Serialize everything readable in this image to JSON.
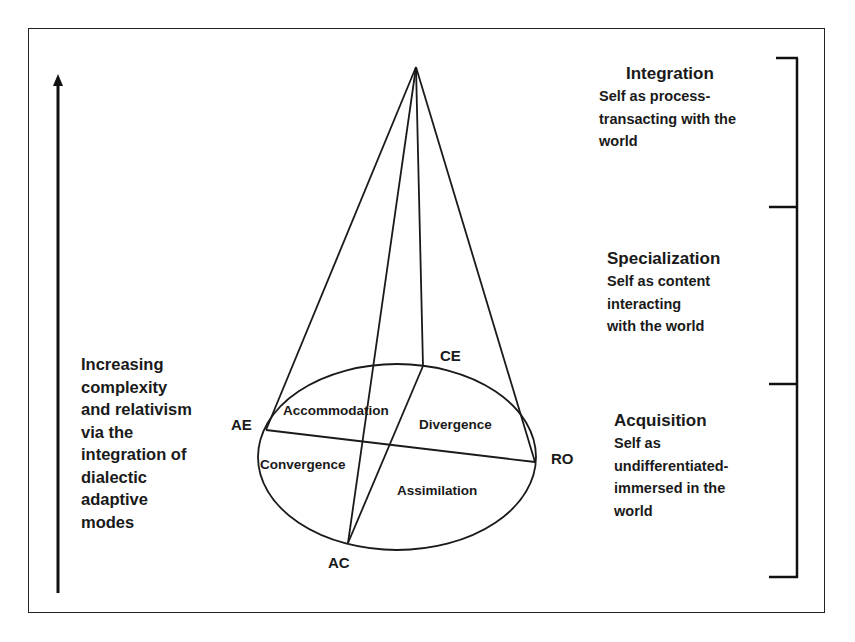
{
  "diagram": {
    "type": "cone-model",
    "axis": {
      "direction": "up",
      "lines": [
        "Increasing",
        "complexity",
        "and relativism",
        "via the",
        "integration of",
        "dialectic",
        "adaptive",
        "modes"
      ]
    },
    "poles": {
      "ae": "AE",
      "ce": "CE",
      "ro": "RO",
      "ac": "AC"
    },
    "modes": {
      "accommodation": "Accommodation",
      "divergence": "Divergence",
      "convergence": "Convergence",
      "assimilation": "Assimilation"
    },
    "stages": [
      {
        "title": "Integration",
        "lines": [
          "Self as process-",
          "transacting with the",
          "world"
        ]
      },
      {
        "title": "Specialization",
        "lines": [
          "Self as content",
          "interacting",
          "with the world"
        ]
      },
      {
        "title": "Acquisition",
        "lines": [
          "Self as",
          "undifferentiated-",
          "immersed in the",
          "world"
        ]
      }
    ],
    "colors": {
      "ink": "#1a1a1a",
      "background": "#ffffff"
    }
  }
}
